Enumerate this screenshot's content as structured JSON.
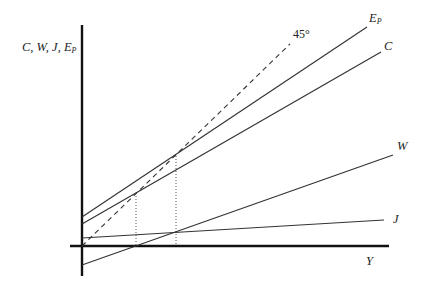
{
  "diagram": {
    "y_axis_label": "C, W, J, E",
    "y_axis_label_sub": "P",
    "x_axis_label": "Y",
    "angle_label": "45°",
    "curves": [
      {
        "name": "E",
        "sub": "P",
        "x1": 82,
        "y1": 217,
        "x2": 367,
        "y2": 27,
        "label_x": 369,
        "label_y": 22
      },
      {
        "name": "C",
        "sub": "",
        "x1": 82,
        "y1": 224,
        "x2": 381,
        "y2": 52,
        "label_x": 384,
        "label_y": 50
      },
      {
        "name": "W",
        "sub": "",
        "x1": 82,
        "y1": 265,
        "x2": 393,
        "y2": 155,
        "label_x": 397,
        "label_y": 150
      },
      {
        "name": "J",
        "sub": "",
        "x1": 82,
        "y1": 238,
        "x2": 384,
        "y2": 220,
        "label_x": 393,
        "label_y": 223
      }
    ],
    "guide_45": {
      "x1": 82,
      "y1": 246,
      "x2": 290,
      "y2": 44,
      "label_x": 293,
      "label_y": 38
    },
    "dotted_verticals": [
      {
        "x": 136,
        "y_top": 193,
        "y_bottom": 246
      },
      {
        "x": 176,
        "y_top": 156,
        "y_bottom": 246
      }
    ],
    "axes": {
      "origin_x": 82,
      "origin_y": 246,
      "y_top": 25,
      "y_bottom": 276,
      "x_left": 70,
      "x_right": 389
    },
    "colors": {
      "line": "#333333",
      "axis": "#111111"
    }
  }
}
